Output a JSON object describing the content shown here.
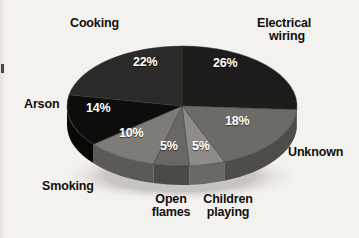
{
  "figure": {
    "title": "",
    "background_color": "#f4f2ee"
  },
  "chart_data": {
    "type": "pie",
    "title": "",
    "xlabel": "",
    "ylabel": "",
    "units": "percent",
    "total": 100,
    "legend_position": "none",
    "grid": false,
    "style": "3d-exploded-none-grayscale",
    "categories": [
      "Electrical wiring",
      "Unknown",
      "Children playing",
      "Open flames",
      "Smoking",
      "Arson",
      "Cooking"
    ],
    "values": [
      26,
      18,
      5,
      5,
      10,
      14,
      22
    ],
    "value_labels": [
      "26%",
      "18%",
      "5%",
      "5%",
      "10%",
      "14%",
      "22%"
    ],
    "colors": [
      "#1d1c1a",
      "#6d6b67",
      "#8e8c88",
      "#6a6865",
      "#7e7c79",
      "#0e0d0c",
      "#2b2a28"
    ],
    "side_colors": [
      "#121110",
      "#4f4d4a",
      "#6b6966",
      "#4c4a47",
      "#5c5a57",
      "#080807",
      "#1a1918"
    ],
    "slices": [
      {
        "label": "Electrical wiring",
        "value": 26,
        "value_label": "26%",
        "color": "#1d1c1a",
        "start_angle": 0,
        "end_angle": 93.6
      },
      {
        "label": "Unknown",
        "value": 18,
        "value_label": "18%",
        "color": "#6d6b67",
        "start_angle": 93.6,
        "end_angle": 158.4
      },
      {
        "label": "Children playing",
        "value": 5,
        "value_label": "5%",
        "color": "#8e8c88",
        "start_angle": 158.4,
        "end_angle": 176.4
      },
      {
        "label": "Open flames",
        "value": 5,
        "value_label": "5%",
        "color": "#6a6865",
        "start_angle": 176.4,
        "end_angle": 194.4
      },
      {
        "label": "Smoking",
        "value": 10,
        "value_label": "10%",
        "color": "#7e7c79",
        "start_angle": 194.4,
        "end_angle": 230.4
      },
      {
        "label": "Arson",
        "value": 14,
        "value_label": "14%",
        "color": "#0e0d0c",
        "start_angle": 230.4,
        "end_angle": 280.8
      },
      {
        "label": "Cooking",
        "value": 22,
        "value_label": "22%",
        "color": "#2b2a28",
        "start_angle": 280.8,
        "end_angle": 360
      }
    ]
  },
  "labels": {
    "cooking": "Cooking",
    "electrical_wiring_line1": "Electrical",
    "electrical_wiring_line2": "wiring",
    "arson": "Arson",
    "unknown": "Unknown",
    "smoking": "Smoking",
    "open_flames_line1": "Open",
    "open_flames_line2": "flames",
    "children_playing_line1": "Children",
    "children_playing_line2": "playing"
  },
  "percentages": {
    "cooking": "22%",
    "electrical_wiring": "26%",
    "arson": "14%",
    "unknown": "18%",
    "smoking": "10%",
    "open_flames": "5%",
    "children_playing": "5%"
  }
}
